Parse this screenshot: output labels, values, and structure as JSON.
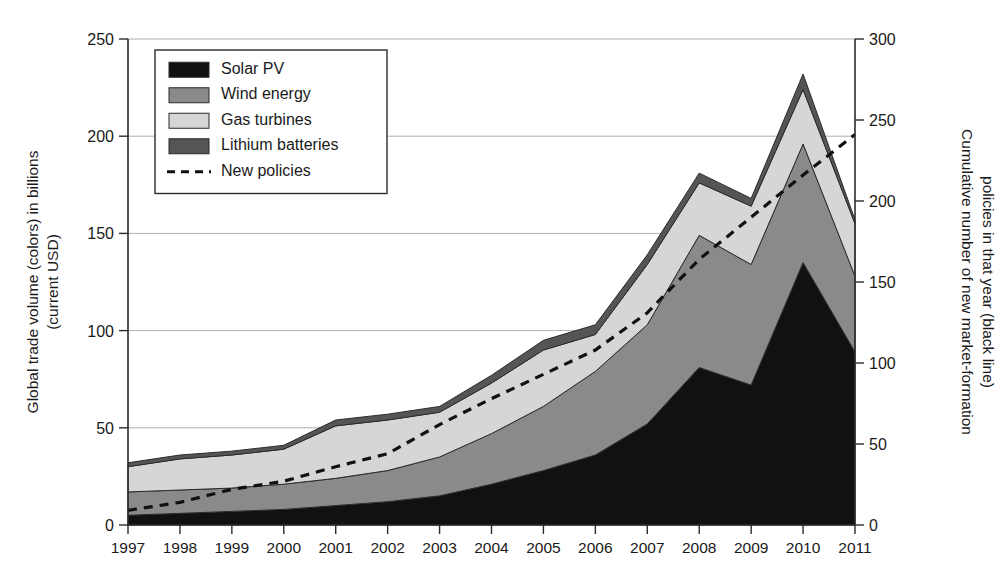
{
  "figure": {
    "width": 1005,
    "height": 575,
    "background": "#ffffff"
  },
  "chart_data": {
    "type": "area",
    "title": "",
    "subtitle": "",
    "stacked": true,
    "grid": true,
    "legend_position": "top-left-inside",
    "xlabel": "",
    "x": [
      1997,
      1998,
      1999,
      2000,
      2001,
      2002,
      2003,
      2004,
      2005,
      2006,
      2007,
      2008,
      2009,
      2010,
      2011
    ],
    "categories": [
      "1997",
      "1998",
      "1999",
      "2000",
      "2001",
      "2002",
      "2003",
      "2004",
      "2005",
      "2006",
      "2007",
      "2008",
      "2009",
      "2010",
      "2011"
    ],
    "ylabel": "Global trade volume (colors) in billions (current USD)",
    "ylim": [
      0,
      250
    ],
    "yticks": [
      0,
      50,
      100,
      150,
      200,
      250
    ],
    "yticklabels": [
      "0",
      "50",
      "100",
      "150",
      "200",
      "250"
    ],
    "y2label": "Cumulative number of new market-formation policies in that year (black line)",
    "y2lim": [
      0,
      300
    ],
    "y2ticks": [
      0,
      50,
      100,
      150,
      200,
      250,
      300
    ],
    "y2ticklabels": [
      "0",
      "50",
      "100",
      "150",
      "200",
      "250",
      "300"
    ],
    "series": [
      {
        "name": "Solar PV",
        "color": "#111111",
        "axis": "left",
        "values": [
          5,
          6,
          7,
          8,
          10,
          12,
          15,
          21,
          28,
          36,
          52,
          81,
          72,
          135,
          89
        ]
      },
      {
        "name": "Wind energy",
        "color": "#8a8a8a",
        "axis": "left",
        "values": [
          12,
          12,
          12,
          13,
          14,
          16,
          20,
          26,
          33,
          43,
          51,
          68,
          62,
          61,
          39
        ]
      },
      {
        "name": "Gas turbines",
        "color": "#d6d6d6",
        "axis": "left",
        "values": [
          13,
          16,
          17,
          18,
          27,
          26,
          23,
          26,
          29,
          19,
          31,
          27,
          30,
          28,
          27
        ]
      },
      {
        "name": "Lithium batteries",
        "color": "#555555",
        "axis": "left",
        "values": [
          2,
          2,
          2,
          2,
          3,
          3,
          3,
          4,
          5,
          5,
          5,
          5,
          4,
          8,
          2
        ]
      }
    ],
    "line_series": {
      "name": "New policies",
      "color": "#111111",
      "style": "dashed",
      "axis": "right",
      "values": [
        9,
        14,
        22,
        27,
        36,
        44,
        62,
        78,
        93,
        108,
        131,
        164,
        190,
        216,
        241
      ]
    },
    "legend": [
      {
        "label": "Solar PV",
        "type": "swatch",
        "color": "#111111"
      },
      {
        "label": "Wind energy",
        "type": "swatch",
        "color": "#8a8a8a"
      },
      {
        "label": "Gas turbines",
        "type": "swatch",
        "color": "#d6d6d6"
      },
      {
        "label": "Lithium batteries",
        "type": "swatch",
        "color": "#555555"
      },
      {
        "label": "New policies",
        "type": "dashed-line",
        "color": "#111111"
      }
    ]
  }
}
